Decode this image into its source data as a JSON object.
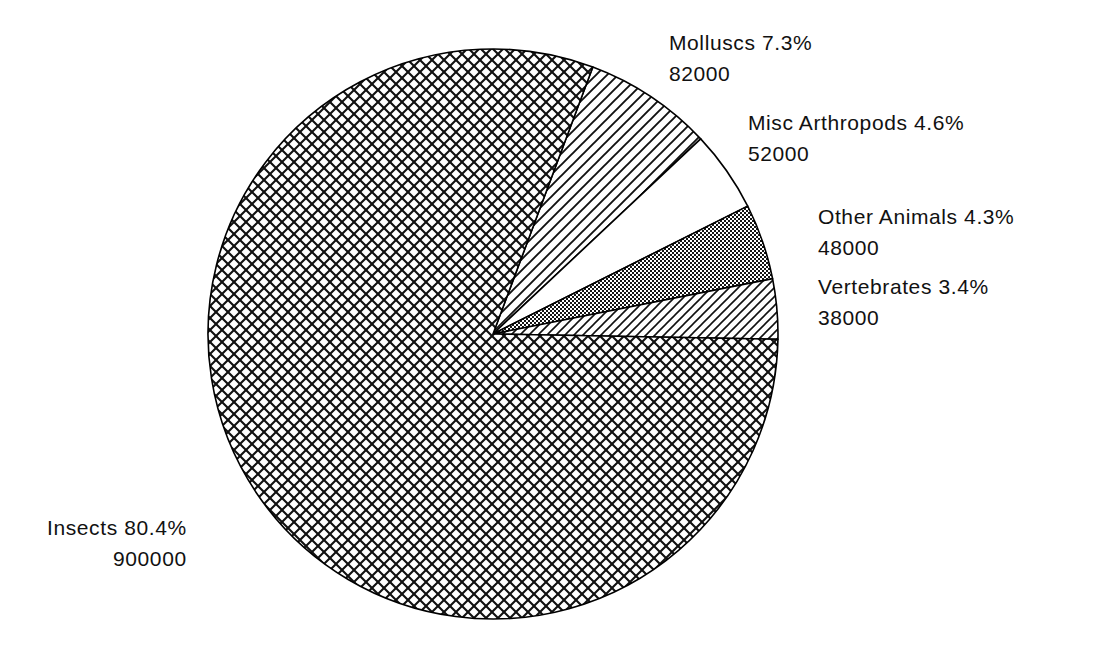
{
  "chart_data": {
    "type": "pie",
    "title": "",
    "subtitle": "",
    "xlabel": "",
    "ylabel": "",
    "legend_position": "none",
    "grid": false,
    "units": "number of described species",
    "total": 1120000,
    "categories": [
      "Molluscs",
      "Misc Arthropods",
      "Other Animals",
      "Vertebrates",
      "Insects"
    ],
    "values": [
      82000,
      52000,
      48000,
      38000,
      900000
    ],
    "percents": [
      7.3,
      4.6,
      4.3,
      3.4,
      80.4
    ],
    "slices": [
      {
        "name": "Molluscs",
        "percent": 7.3,
        "value": 82000,
        "percent_text": "7.3%",
        "value_text": "82000",
        "label_text": "Molluscs  7.3%",
        "fill": "diagonal-stripes",
        "fill_color": "#1a1a1a",
        "start_angle_deg": 69.5,
        "end_angle_deg": 43.2
      },
      {
        "name": "Misc Arthropods",
        "percent": 4.6,
        "value": 52000,
        "percent_text": "4.6%",
        "value_text": "52000",
        "label_text": "Misc  Arthropods  4.6%",
        "fill": "blank-white",
        "fill_color": "#ffffff",
        "start_angle_deg": 43.2,
        "end_angle_deg": 26.6
      },
      {
        "name": "Other Animals",
        "percent": 4.3,
        "value": 48000,
        "percent_text": "4.3%",
        "value_text": "48000",
        "label_text": "Other  Animals  4.3%",
        "fill": "fine-checkerboard",
        "fill_color": "#1a1a1a",
        "start_angle_deg": 26.6,
        "end_angle_deg": 11.1
      },
      {
        "name": "Vertebrates",
        "percent": 3.4,
        "value": 38000,
        "percent_text": "3.4%",
        "value_text": "38000",
        "label_text": "Vertebrates  3.4%",
        "fill": "diagonal-hatch",
        "fill_color": "#1a1a1a",
        "start_angle_deg": 11.1,
        "end_angle_deg": 0.0
      },
      {
        "name": "Insects",
        "percent": 80.4,
        "value": 900000,
        "percent_text": "80.4%",
        "value_text": "900000",
        "label_text": "Insects  80.4%",
        "fill": "diamond-crosshatch",
        "fill_color": "#1a1a1a",
        "start_angle_deg": 0.0,
        "end_angle_deg": -289.5
      }
    ],
    "geometry": {
      "center_x": 493,
      "center_y": 334,
      "radius": 285,
      "start_angle_deg": 69.5,
      "direction": "clockwise"
    },
    "colors": {
      "background": "#ffffff",
      "stroke": "#000000",
      "text": "#111111"
    }
  },
  "labels": {
    "molluscs": {
      "name": "Molluscs  7.3%",
      "value": "82000"
    },
    "misc_arthropods": {
      "name": "Misc  Arthropods  4.6%",
      "value": "52000"
    },
    "other_animals": {
      "name": "Other  Animals  4.3%",
      "value": "48000"
    },
    "vertebrates": {
      "name": "Vertebrates  3.4%",
      "value": "38000"
    },
    "insects": {
      "name": "Insects  80.4%",
      "value": "900000"
    }
  }
}
